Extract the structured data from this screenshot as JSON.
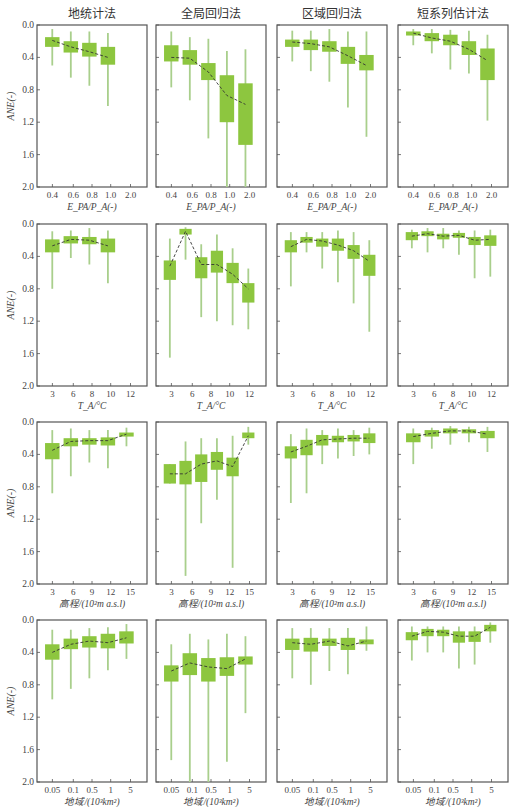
{
  "column_titles": [
    "地统计法",
    "全局回归法",
    "区域回归法",
    "短系列估计法"
  ],
  "y_axis": {
    "label": "ANE(-)",
    "ticks": [
      "0.0",
      "0.4",
      "0.8",
      "1.2",
      "1.6",
      "2.0"
    ],
    "range": [
      0.0,
      2.0
    ],
    "inverted": true
  },
  "colors": {
    "box": "#8dc63f",
    "whisker": "#a9cf8c",
    "frame": "#555555",
    "trend": "#333333"
  },
  "chart_data": [
    {
      "type": "box",
      "row": 0,
      "xlabel": "E_PA/P_A(-)",
      "xlabel_html": [
        "E",
        "PA",
        "/P",
        "A",
        "(-)"
      ],
      "xticks": [
        "0.4",
        "0.6",
        "0.8",
        "1.0",
        "2.0"
      ],
      "panels": [
        {
          "title": "地统计法",
          "boxes": [
            {
              "q1": 0.15,
              "q3": 0.27,
              "lo": 0.05,
              "hi": 0.5,
              "med": 0.19
            },
            {
              "q1": 0.2,
              "q3": 0.34,
              "lo": 0.08,
              "hi": 0.65,
              "med": 0.27
            },
            {
              "q1": 0.22,
              "q3": 0.39,
              "lo": 0.08,
              "hi": 0.75,
              "med": 0.33
            },
            {
              "q1": 0.27,
              "q3": 0.49,
              "lo": 0.1,
              "hi": 1.0,
              "med": 0.4
            }
          ]
        },
        {
          "title": "全局回归法",
          "boxes": [
            {
              "q1": 0.25,
              "q3": 0.45,
              "lo": 0.08,
              "hi": 0.77,
              "med": 0.4
            },
            {
              "q1": 0.31,
              "q3": 0.49,
              "lo": 0.15,
              "hi": 0.93,
              "med": 0.41
            },
            {
              "q1": 0.47,
              "q3": 0.68,
              "lo": 0.17,
              "hi": 1.4,
              "med": 0.58
            },
            {
              "q1": 0.62,
              "q3": 1.2,
              "lo": 0.32,
              "hi": 2.0,
              "med": 0.87
            },
            {
              "q1": 0.72,
              "q3": 1.48,
              "lo": 0.3,
              "hi": 2.0,
              "med": 0.98
            }
          ]
        },
        {
          "title": "区域回归法",
          "boxes": [
            {
              "q1": 0.18,
              "q3": 0.27,
              "lo": 0.07,
              "hi": 0.45,
              "med": 0.21
            },
            {
              "q1": 0.18,
              "q3": 0.31,
              "lo": 0.07,
              "hi": 0.57,
              "med": 0.23
            },
            {
              "q1": 0.2,
              "q3": 0.33,
              "lo": 0.05,
              "hi": 0.7,
              "med": 0.27
            },
            {
              "q1": 0.27,
              "q3": 0.48,
              "lo": 0.08,
              "hi": 1.02,
              "med": 0.38
            },
            {
              "q1": 0.37,
              "q3": 0.56,
              "lo": 0.08,
              "hi": 1.38,
              "med": 0.5
            }
          ]
        },
        {
          "title": "短系列估计法",
          "boxes": [
            {
              "q1": 0.08,
              "q3": 0.13,
              "lo": 0.05,
              "hi": 0.25,
              "med": 0.1
            },
            {
              "q1": 0.1,
              "q3": 0.2,
              "lo": 0.05,
              "hi": 0.35,
              "med": 0.16
            },
            {
              "q1": 0.12,
              "q3": 0.25,
              "lo": 0.06,
              "hi": 0.55,
              "med": 0.2
            },
            {
              "q1": 0.2,
              "q3": 0.37,
              "lo": 0.07,
              "hi": 0.6,
              "med": 0.3
            },
            {
              "q1": 0.29,
              "q3": 0.68,
              "lo": 0.12,
              "hi": 1.18,
              "med": 0.44
            }
          ]
        }
      ]
    },
    {
      "type": "box",
      "row": 1,
      "xlabel": "T_A/°C",
      "xticks": [
        "3",
        "6",
        "8",
        "10",
        "12"
      ],
      "panels": [
        {
          "title": "地统计法",
          "boxes": [
            {
              "q1": 0.19,
              "q3": 0.35,
              "lo": 0.09,
              "hi": 0.8,
              "med": 0.27
            },
            {
              "q1": 0.15,
              "q3": 0.24,
              "lo": 0.08,
              "hi": 0.42,
              "med": 0.19
            },
            {
              "q1": 0.16,
              "q3": 0.25,
              "lo": 0.05,
              "hi": 0.5,
              "med": 0.2
            },
            {
              "q1": 0.18,
              "q3": 0.35,
              "lo": 0.08,
              "hi": 0.73,
              "med": 0.27
            }
          ]
        },
        {
          "title": "全局回归法",
          "boxes": [
            {
              "q1": 0.45,
              "q3": 0.69,
              "lo": 0.18,
              "hi": 1.65,
              "med": 0.52
            },
            {
              "q1": 0.06,
              "q3": 0.13,
              "lo": 0.04,
              "hi": 0.44,
              "med": 0.09
            },
            {
              "q1": 0.41,
              "q3": 0.67,
              "lo": 0.25,
              "hi": 1.15,
              "med": 0.5
            },
            {
              "q1": 0.33,
              "q3": 0.6,
              "lo": 0.13,
              "hi": 1.2,
              "med": 0.5
            },
            {
              "q1": 0.48,
              "q3": 0.73,
              "lo": 0.3,
              "hi": 1.25,
              "med": 0.62
            },
            {
              "q1": 0.73,
              "q3": 0.97,
              "lo": 0.55,
              "hi": 1.3,
              "med": 0.8
            }
          ]
        },
        {
          "title": "区域回归法",
          "boxes": [
            {
              "q1": 0.2,
              "q3": 0.35,
              "lo": 0.1,
              "hi": 0.77,
              "med": 0.28
            },
            {
              "q1": 0.16,
              "q3": 0.23,
              "lo": 0.1,
              "hi": 0.35,
              "med": 0.19
            },
            {
              "q1": 0.18,
              "q3": 0.28,
              "lo": 0.1,
              "hi": 0.55,
              "med": 0.21
            },
            {
              "q1": 0.18,
              "q3": 0.33,
              "lo": 0.08,
              "hi": 0.72,
              "med": 0.26
            },
            {
              "q1": 0.26,
              "q3": 0.43,
              "lo": 0.1,
              "hi": 0.98,
              "med": 0.33
            },
            {
              "q1": 0.38,
              "q3": 0.64,
              "lo": 0.2,
              "hi": 1.33,
              "med": 0.46
            }
          ]
        },
        {
          "title": "短系列估计法",
          "boxes": [
            {
              "q1": 0.1,
              "q3": 0.2,
              "lo": 0.07,
              "hi": 0.3,
              "med": 0.15
            },
            {
              "q1": 0.09,
              "q3": 0.15,
              "lo": 0.05,
              "hi": 0.35,
              "med": 0.12
            },
            {
              "q1": 0.12,
              "q3": 0.19,
              "lo": 0.05,
              "hi": 0.3,
              "med": 0.15
            },
            {
              "q1": 0.11,
              "q3": 0.17,
              "lo": 0.08,
              "hi": 0.38,
              "med": 0.14
            },
            {
              "q1": 0.16,
              "q3": 0.26,
              "lo": 0.08,
              "hi": 0.67,
              "med": 0.2
            },
            {
              "q1": 0.14,
              "q3": 0.27,
              "lo": 0.07,
              "hi": 0.65,
              "med": 0.19
            }
          ]
        }
      ]
    },
    {
      "type": "box",
      "row": 2,
      "xlabel": "高程/(10²m a.s.l)",
      "xticks": [
        "3",
        "6",
        "9",
        "12",
        "15"
      ],
      "panels": [
        {
          "title": "地统计法",
          "boxes": [
            {
              "q1": 0.26,
              "q3": 0.46,
              "lo": 0.1,
              "hi": 0.88,
              "med": 0.35
            },
            {
              "q1": 0.2,
              "q3": 0.3,
              "lo": 0.08,
              "hi": 0.67,
              "med": 0.24
            },
            {
              "q1": 0.2,
              "q3": 0.28,
              "lo": 0.1,
              "hi": 0.5,
              "med": 0.23
            },
            {
              "q1": 0.19,
              "q3": 0.29,
              "lo": 0.1,
              "hi": 0.57,
              "med": 0.23
            },
            {
              "q1": 0.13,
              "q3": 0.18,
              "lo": 0.07,
              "hi": 0.3,
              "med": 0.15
            }
          ]
        },
        {
          "title": "全局回归法",
          "boxes": [
            {
              "q1": 0.52,
              "q3": 0.76,
              "lo": 0.52,
              "hi": 0.76,
              "med": 0.64
            },
            {
              "q1": 0.48,
              "q3": 0.77,
              "lo": 0.24,
              "hi": 1.9,
              "med": 0.64
            },
            {
              "q1": 0.4,
              "q3": 0.74,
              "lo": 0.2,
              "hi": 1.25,
              "med": 0.52
            },
            {
              "q1": 0.37,
              "q3": 0.59,
              "lo": 0.2,
              "hi": 0.96,
              "med": 0.48
            },
            {
              "q1": 0.44,
              "q3": 0.67,
              "lo": 0.17,
              "hi": 1.8,
              "med": 0.55
            },
            {
              "q1": 0.13,
              "q3": 0.2,
              "lo": 0.06,
              "hi": 0.28,
              "med": 0.17
            }
          ]
        },
        {
          "title": "区域回归法",
          "boxes": [
            {
              "q1": 0.3,
              "q3": 0.45,
              "lo": 0.15,
              "hi": 1.0,
              "med": 0.37
            },
            {
              "q1": 0.22,
              "q3": 0.41,
              "lo": 0.08,
              "hi": 0.88,
              "med": 0.3
            },
            {
              "q1": 0.16,
              "q3": 0.29,
              "lo": 0.1,
              "hi": 0.52,
              "med": 0.22
            },
            {
              "q1": 0.17,
              "q3": 0.25,
              "lo": 0.08,
              "hi": 0.45,
              "med": 0.21
            },
            {
              "q1": 0.16,
              "q3": 0.24,
              "lo": 0.1,
              "hi": 0.42,
              "med": 0.2
            },
            {
              "q1": 0.14,
              "q3": 0.26,
              "lo": 0.07,
              "hi": 0.4,
              "med": 0.2
            }
          ]
        },
        {
          "title": "短系列估计法",
          "boxes": [
            {
              "q1": 0.14,
              "q3": 0.25,
              "lo": 0.08,
              "hi": 0.52,
              "med": 0.18
            },
            {
              "q1": 0.1,
              "q3": 0.18,
              "lo": 0.07,
              "hi": 0.33,
              "med": 0.14
            },
            {
              "q1": 0.08,
              "q3": 0.14,
              "lo": 0.05,
              "hi": 0.28,
              "med": 0.11
            },
            {
              "q1": 0.09,
              "q3": 0.14,
              "lo": 0.06,
              "hi": 0.25,
              "med": 0.11
            },
            {
              "q1": 0.11,
              "q3": 0.2,
              "lo": 0.06,
              "hi": 0.37,
              "med": 0.15
            }
          ]
        }
      ]
    },
    {
      "type": "box",
      "row": 3,
      "xlabel": "地域/(10³km²)",
      "xticks": [
        "0.05",
        "0.1",
        "0.5",
        "1",
        "5"
      ],
      "panels": [
        {
          "title": "地统计法",
          "boxes": [
            {
              "q1": 0.3,
              "q3": 0.49,
              "lo": 0.12,
              "hi": 0.98,
              "med": 0.4
            },
            {
              "q1": 0.23,
              "q3": 0.36,
              "lo": 0.12,
              "hi": 0.85,
              "med": 0.3
            },
            {
              "q1": 0.2,
              "q3": 0.34,
              "lo": 0.1,
              "hi": 0.72,
              "med": 0.26
            },
            {
              "q1": 0.17,
              "q3": 0.35,
              "lo": 0.09,
              "hi": 0.62,
              "med": 0.28
            },
            {
              "q1": 0.14,
              "q3": 0.29,
              "lo": 0.05,
              "hi": 0.48,
              "med": 0.22
            }
          ]
        },
        {
          "title": "全局回归法",
          "boxes": [
            {
              "q1": 0.56,
              "q3": 0.76,
              "lo": 0.3,
              "hi": 1.73,
              "med": 0.63
            },
            {
              "q1": 0.41,
              "q3": 0.68,
              "lo": 0.17,
              "hi": 2.0,
              "med": 0.53
            },
            {
              "q1": 0.47,
              "q3": 0.76,
              "lo": 0.24,
              "hi": 2.0,
              "med": 0.58
            },
            {
              "q1": 0.46,
              "q3": 0.69,
              "lo": 0.17,
              "hi": 1.75,
              "med": 0.6
            },
            {
              "q1": 0.45,
              "q3": 0.55,
              "lo": 0.2,
              "hi": 1.15,
              "med": 0.48
            }
          ]
        },
        {
          "title": "区域回归法",
          "boxes": [
            {
              "q1": 0.23,
              "q3": 0.37,
              "lo": 0.1,
              "hi": 0.72,
              "med": 0.28
            },
            {
              "q1": 0.22,
              "q3": 0.39,
              "lo": 0.1,
              "hi": 0.8,
              "med": 0.3
            },
            {
              "q1": 0.23,
              "q3": 0.32,
              "lo": 0.1,
              "hi": 0.63,
              "med": 0.26
            },
            {
              "q1": 0.22,
              "q3": 0.37,
              "lo": 0.1,
              "hi": 0.67,
              "med": 0.32
            },
            {
              "q1": 0.24,
              "q3": 0.3,
              "lo": 0.08,
              "hi": 0.38,
              "med": 0.26
            }
          ]
        },
        {
          "title": "短系列估计法",
          "boxes": [
            {
              "q1": 0.15,
              "q3": 0.25,
              "lo": 0.08,
              "hi": 0.5,
              "med": 0.2
            },
            {
              "q1": 0.11,
              "q3": 0.2,
              "lo": 0.08,
              "hi": 0.4,
              "med": 0.14
            },
            {
              "q1": 0.12,
              "q3": 0.2,
              "lo": 0.08,
              "hi": 0.4,
              "med": 0.15
            },
            {
              "q1": 0.14,
              "q3": 0.28,
              "lo": 0.08,
              "hi": 0.6,
              "med": 0.2
            },
            {
              "q1": 0.14,
              "q3": 0.27,
              "lo": 0.08,
              "hi": 0.55,
              "med": 0.2
            },
            {
              "q1": 0.06,
              "q3": 0.14,
              "lo": 0.03,
              "hi": 0.28,
              "med": 0.09
            }
          ]
        }
      ]
    }
  ]
}
